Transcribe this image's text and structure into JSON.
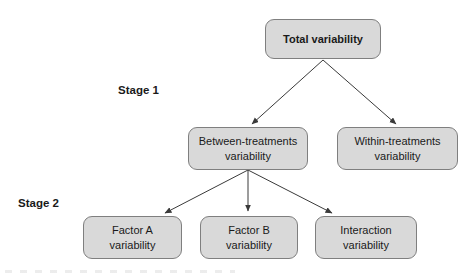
{
  "diagram": {
    "type": "flowchart",
    "stage_labels": [
      {
        "text": "Stage 1"
      },
      {
        "text": "Stage 2"
      }
    ],
    "nodes": [
      {
        "id": "total",
        "label": "Total variability"
      },
      {
        "id": "between-treatments",
        "label": "Between-treatments\nvariability"
      },
      {
        "id": "within-treatments",
        "label": "Within-treatments\nvariability"
      },
      {
        "id": "factor-a",
        "label": "Factor A\nvariability"
      },
      {
        "id": "factor-b",
        "label": "Factor B\nvariability"
      },
      {
        "id": "interaction",
        "label": "Interaction\nvariability"
      }
    ],
    "edges": [
      {
        "from": "total",
        "to": "between-treatments"
      },
      {
        "from": "total",
        "to": "within-treatments"
      },
      {
        "from": "between-treatments",
        "to": "factor-a"
      },
      {
        "from": "between-treatments",
        "to": "factor-b"
      },
      {
        "from": "between-treatments",
        "to": "interaction"
      }
    ],
    "colors": {
      "node_fill": "#d9d9d9",
      "node_border": "#7f7f7f",
      "arrow": "#3a3a3a",
      "text": "#1a1a1a"
    }
  }
}
